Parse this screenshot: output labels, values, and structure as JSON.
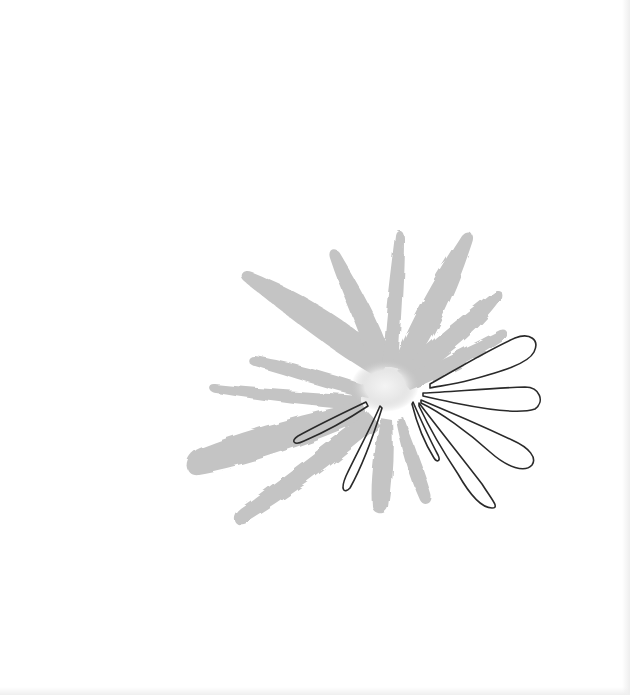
{
  "artwork": {
    "subject": "Watercolor flower with outlined petals",
    "colors": {
      "background": "#ffffff",
      "wash": "#c4c4c4",
      "wash_light": "#d8d8d8",
      "center": "#eeeeee",
      "outline": "#2a2a2a"
    },
    "elements": {
      "wash_petals": "gray watercolor petals radiating from center",
      "outline_petals": "black line-drawn petals over the lower right"
    }
  }
}
